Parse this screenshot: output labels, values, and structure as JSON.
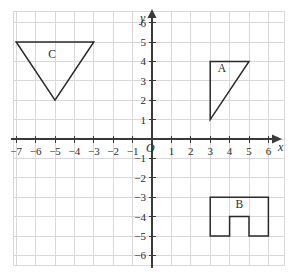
{
  "chart_data": {
    "type": "scatter",
    "title": "",
    "xlabel": "x",
    "ylabel": "y",
    "origin_label": "O",
    "grid": true,
    "legend": "none",
    "xlim": [
      -7.7,
      6.9
    ],
    "ylim": [
      -6.6,
      6.6
    ],
    "x_ticks": [
      -7,
      -6,
      -5,
      -4,
      -3,
      -2,
      -1,
      1,
      2,
      3,
      4,
      5,
      6
    ],
    "y_ticks": [
      6,
      5,
      4,
      3,
      2,
      1,
      -1,
      -2,
      -3,
      -4,
      -5,
      -6
    ],
    "x_tick_labels": [
      "−7",
      "−6",
      "−5",
      "−4",
      "−3",
      "−2",
      "−1",
      "1",
      "2",
      "3",
      "4",
      "5",
      "6"
    ],
    "y_tick_labels": [
      "6",
      "5",
      "4",
      "3",
      "2",
      "1",
      "−1",
      "−2",
      "−3",
      "−4",
      "−5",
      "−6"
    ],
    "shapes": [
      {
        "name": "A",
        "label": "A",
        "kind": "triangle",
        "vertices": [
          [
            3,
            4
          ],
          [
            5,
            4
          ],
          [
            3,
            1
          ]
        ],
        "closed": true,
        "label_position": [
          3.6,
          3.45
        ]
      },
      {
        "name": "B",
        "label": "B",
        "kind": "notched-rectangle",
        "vertices": [
          [
            3,
            -3
          ],
          [
            6,
            -3
          ],
          [
            6,
            -5
          ],
          [
            5,
            -5
          ],
          [
            5,
            -4
          ],
          [
            4,
            -4
          ],
          [
            4,
            -5
          ],
          [
            3,
            -5
          ]
        ],
        "closed": true,
        "label_position": [
          4.5,
          -3.55
        ]
      },
      {
        "name": "C",
        "label": "C",
        "kind": "triangle",
        "vertices": [
          [
            -7,
            5
          ],
          [
            -3,
            5
          ],
          [
            -5,
            2
          ]
        ],
        "closed": true,
        "label_position": [
          -5.15,
          4.2
        ]
      }
    ]
  },
  "axes": {
    "x_axis_name": "x",
    "y_axis_name": "y",
    "origin": "O"
  },
  "colors": {
    "grid": "#d8d8dc",
    "axis": "#3a3a3a",
    "shape_stroke": "#2a2a2a",
    "text": "#2b2b2b",
    "background": "#ffffff"
  }
}
